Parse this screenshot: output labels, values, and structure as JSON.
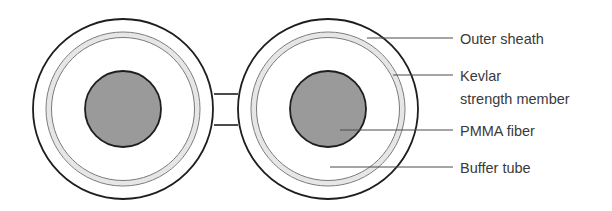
{
  "diagram": {
    "colors": {
      "stroke": "#1e1e1e",
      "kevlar_band": "#e6e6e6",
      "kevlar_stroke": "#7a7a7a",
      "core_fill": "#9a9a9a",
      "leader": "#4a4a4a",
      "text": "#3a3a3a"
    },
    "labels": {
      "outer_sheath": "Outer sheath",
      "kevlar_line1": "Kevlar",
      "kevlar_line2": "strength member",
      "pmma_fiber": "PMMA fiber",
      "buffer_tube": "Buffer tube"
    }
  }
}
